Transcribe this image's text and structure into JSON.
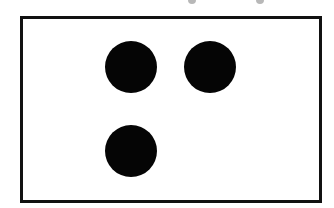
{
  "figure": {
    "frame": {
      "left": 20,
      "top": 16,
      "right": 322,
      "bottom": 203,
      "border_px": 3,
      "border_color": "#111111",
      "fill": "#ffffff"
    },
    "dots": [
      {
        "cx": 131,
        "cy": 67,
        "r": 26,
        "color": "#050505"
      },
      {
        "cx": 210,
        "cy": 67,
        "r": 26,
        "color": "#050505"
      },
      {
        "cx": 131,
        "cy": 151,
        "r": 26,
        "color": "#050505"
      }
    ],
    "dot_count": 3,
    "top_edge_marks": [
      {
        "x": 188
      },
      {
        "x": 256
      }
    ]
  }
}
